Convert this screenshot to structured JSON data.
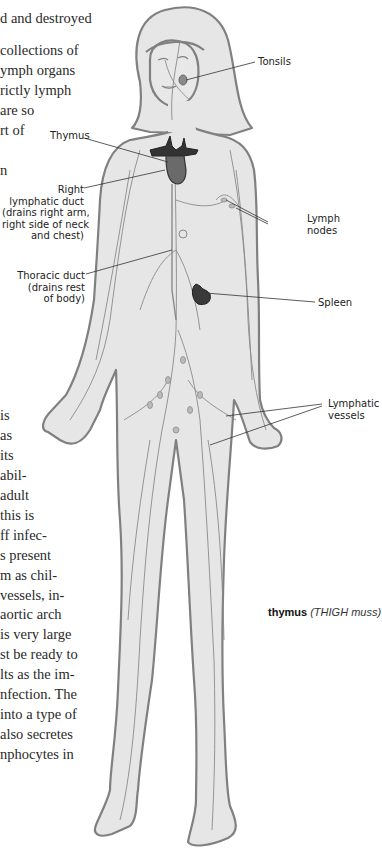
{
  "text_column": {
    "top_lines": [
      "d and destroyed",
      "",
      "collections of",
      "ymph organs",
      "rictly lymph",
      " are so",
      "rt of",
      "",
      "n"
    ],
    "middle_lines": [
      "is",
      " as",
      " its",
      "abil-",
      "adult",
      " this is",
      "ff infec-",
      "s present",
      "m as chil-",
      "vessels, in-"
    ],
    "bottom_lines": [
      " aortic arch",
      " is very large",
      "st be ready to",
      "lts as the im-",
      "nfection. The",
      "into a type of",
      " also secretes",
      "nphocytes in"
    ]
  },
  "figure": {
    "colors": {
      "skin_fill": "#e6e6e6",
      "outline": "#808080",
      "vessel": "#8a8a8a",
      "thymus": "#333333",
      "thymus_body": "#6a6a6a",
      "spleen": "#3a3a3a",
      "leader_line": "#333333"
    },
    "labels": {
      "tonsils": "Tonsils",
      "thymus": "Thymus",
      "right_duct": [
        "Right",
        "lymphatic duct",
        "(drains right arm,",
        "right side of neck",
        "and chest)"
      ],
      "lymph_nodes": [
        "Lymph",
        "nodes"
      ],
      "thoracic_duct": [
        "Thoracic duct",
        "(drains rest",
        "of body)"
      ],
      "spleen": "Spleen",
      "lymphatic_vessels": [
        "Lymphatic",
        "vessels"
      ]
    }
  },
  "glossary": {
    "term": "thymus",
    "pronunciation": "(THIGH muss)"
  }
}
